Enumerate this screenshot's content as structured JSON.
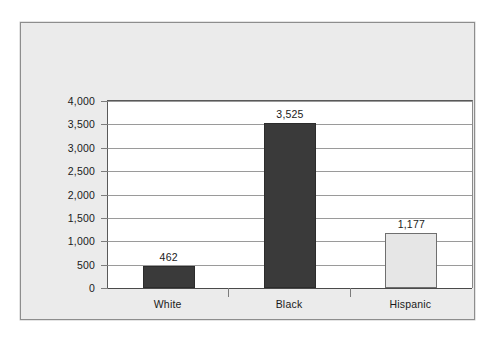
{
  "chart_data": {
    "type": "bar",
    "title": "",
    "subtitle": "",
    "xlabel": "",
    "ylabel": "",
    "categories": [
      "White",
      "Black",
      "Hispanic"
    ],
    "values": [
      462,
      3525,
      1177
    ],
    "value_labels": [
      "462",
      "3,525",
      "1,177"
    ],
    "series": [
      {
        "name": "",
        "values": [
          462,
          3525,
          1177
        ]
      }
    ],
    "ylim": [
      0,
      4000
    ],
    "ytick_values": [
      0,
      500,
      1000,
      1500,
      2000,
      2500,
      3000,
      3500,
      4000
    ],
    "ytick_labels": [
      "0",
      "500",
      "1,000",
      "1,500",
      "2,000",
      "2,500",
      "3,000",
      "3,500",
      "4,000"
    ],
    "grid": true,
    "legend": false,
    "legend_position": "none",
    "bar_colors": [
      "#3a3a3a",
      "#3a3a3a",
      "#e6e6e6"
    ],
    "bar_border_colors": [
      "#2c2c2c",
      "#2c2c2c",
      "#6f6f6f"
    ]
  },
  "style": {
    "panel_background": "#ebebeb",
    "plot_background": "#ffffff",
    "page_background": "#ffffff",
    "frame_border": "#8d8d8d",
    "gridline_color": "#9a9a9a",
    "axis_color": "#595959",
    "text_color": "#1a1a1a"
  }
}
